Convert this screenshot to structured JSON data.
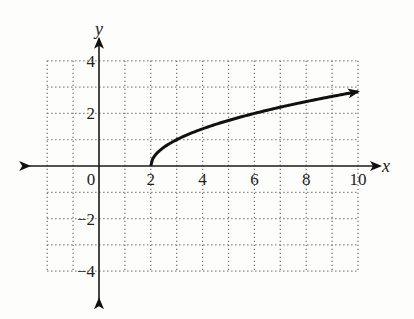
{
  "chart_data": {
    "type": "line",
    "title": "",
    "xlabel": "x",
    "ylabel": "y",
    "xlim": [
      -2,
      10
    ],
    "ylim": [
      -4,
      4
    ],
    "grid": true,
    "grid_step": 1,
    "x_ticks": [
      {
        "value": 0,
        "label": "0"
      },
      {
        "value": 2,
        "label": "2"
      },
      {
        "value": 4,
        "label": "4"
      },
      {
        "value": 6,
        "label": "6"
      },
      {
        "value": 8,
        "label": "8"
      },
      {
        "value": 10,
        "label": "10"
      }
    ],
    "y_ticks": [
      {
        "value": 4,
        "label": "4"
      },
      {
        "value": 2,
        "label": "2"
      },
      {
        "value": -2,
        "label": "−2"
      },
      {
        "value": -4,
        "label": "−4"
      }
    ],
    "series": [
      {
        "name": "y = sqrt(x - 2)",
        "function": "sqrt(x-2)",
        "domain": [
          2,
          10
        ],
        "endpoint_arrow": "end",
        "x": [
          2,
          2.25,
          2.5,
          3,
          4,
          5,
          6,
          7,
          8,
          9,
          10
        ],
        "y": [
          0,
          0.5,
          0.71,
          1,
          1.41,
          1.73,
          2,
          2.24,
          2.45,
          2.65,
          2.83
        ]
      }
    ]
  }
}
